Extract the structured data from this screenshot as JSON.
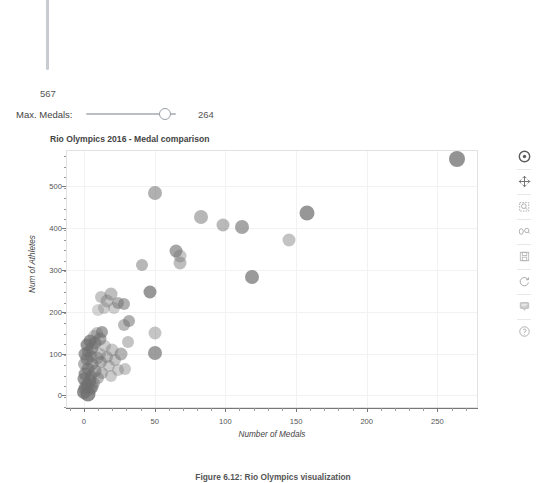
{
  "widgets": {
    "vertical_slider": {
      "name": "max-athletes-slider",
      "value": "567"
    },
    "horizontal_slider": {
      "label": "Max. Medals:",
      "value": "264",
      "handle_position_pct": 81
    }
  },
  "plot": {
    "title": "Rio Olympics 2016 - Medal comparison",
    "toolbar_icons": [
      "bokeh-logo-icon",
      "pan-icon",
      "box-zoom-icon",
      "wheel-zoom-icon",
      "save-icon",
      "reset-icon",
      "hover-icon",
      "help-icon"
    ]
  },
  "caption": "Figure 6.12: Rio Olympics visualization",
  "colors": {
    "point": "#6f6f6f",
    "grid": "#f2f2f2",
    "frame_border": "#e2e2e2",
    "axis": "#777777",
    "text": "#444444"
  },
  "chart_data": {
    "type": "scatter",
    "title": "Rio Olympics 2016 - Medal comparison",
    "xlabel": "Number of Medals",
    "ylabel": "Num of Athletes",
    "xlim": [
      -12,
      278
    ],
    "ylim": [
      -28,
      585
    ],
    "xticks": [
      0,
      50,
      100,
      150,
      200,
      250
    ],
    "yticks": [
      0,
      100,
      200,
      300,
      400,
      500
    ],
    "grid": true,
    "legend": null,
    "marker": "circle",
    "points": [
      {
        "x": 264,
        "y": 567,
        "r": 8.0,
        "a": 0.75
      },
      {
        "x": 50,
        "y": 484,
        "r": 7.0,
        "a": 0.55
      },
      {
        "x": 158,
        "y": 437,
        "r": 7.5,
        "a": 0.72
      },
      {
        "x": 83,
        "y": 427,
        "r": 7.0,
        "a": 0.5
      },
      {
        "x": 98,
        "y": 408,
        "r": 6.5,
        "a": 0.48
      },
      {
        "x": 112,
        "y": 402,
        "r": 7.0,
        "a": 0.62
      },
      {
        "x": 145,
        "y": 372,
        "r": 6.5,
        "a": 0.42
      },
      {
        "x": 65,
        "y": 346,
        "r": 6.5,
        "a": 0.62
      },
      {
        "x": 68,
        "y": 333,
        "r": 6.5,
        "a": 0.38
      },
      {
        "x": 68,
        "y": 318,
        "r": 6.5,
        "a": 0.45
      },
      {
        "x": 41,
        "y": 312,
        "r": 6.0,
        "a": 0.5
      },
      {
        "x": 119,
        "y": 284,
        "r": 7.0,
        "a": 0.7
      },
      {
        "x": 47,
        "y": 248,
        "r": 6.5,
        "a": 0.72
      },
      {
        "x": 19,
        "y": 242,
        "r": 6.5,
        "a": 0.45
      },
      {
        "x": 12,
        "y": 236,
        "r": 6.0,
        "a": 0.4
      },
      {
        "x": 16,
        "y": 225,
        "r": 6.5,
        "a": 0.4
      },
      {
        "x": 24,
        "y": 222,
        "r": 6.0,
        "a": 0.52
      },
      {
        "x": 28,
        "y": 218,
        "r": 6.0,
        "a": 0.55
      },
      {
        "x": 14,
        "y": 210,
        "r": 6.0,
        "a": 0.34
      },
      {
        "x": 21,
        "y": 208,
        "r": 6.0,
        "a": 0.34
      },
      {
        "x": 10,
        "y": 205,
        "r": 6.0,
        "a": 0.3
      },
      {
        "x": 32,
        "y": 178,
        "r": 6.0,
        "a": 0.55
      },
      {
        "x": 28,
        "y": 168,
        "r": 6.0,
        "a": 0.48
      },
      {
        "x": 50,
        "y": 150,
        "r": 6.5,
        "a": 0.4
      },
      {
        "x": 13,
        "y": 152,
        "r": 6.0,
        "a": 0.62
      },
      {
        "x": 9,
        "y": 148,
        "r": 6.0,
        "a": 0.42
      },
      {
        "x": 11,
        "y": 136,
        "r": 6.5,
        "a": 0.58
      },
      {
        "x": 4,
        "y": 130,
        "r": 6.5,
        "a": 0.7
      },
      {
        "x": 8,
        "y": 126,
        "r": 6.5,
        "a": 0.66
      },
      {
        "x": 31,
        "y": 128,
        "r": 6.0,
        "a": 0.42
      },
      {
        "x": 2,
        "y": 120,
        "r": 6.5,
        "a": 0.72
      },
      {
        "x": 6,
        "y": 113,
        "r": 6.5,
        "a": 0.6
      },
      {
        "x": 20,
        "y": 108,
        "r": 6.5,
        "a": 0.38
      },
      {
        "x": 3,
        "y": 104,
        "r": 6.0,
        "a": 0.58
      },
      {
        "x": 50,
        "y": 101,
        "r": 7.0,
        "a": 0.68
      },
      {
        "x": 26,
        "y": 100,
        "r": 6.5,
        "a": 0.52
      },
      {
        "x": 1,
        "y": 98,
        "r": 6.5,
        "a": 0.66
      },
      {
        "x": 5,
        "y": 94,
        "r": 6.0,
        "a": 0.5
      },
      {
        "x": 9,
        "y": 90,
        "r": 6.5,
        "a": 0.46
      },
      {
        "x": 16,
        "y": 92,
        "r": 6.0,
        "a": 0.44
      },
      {
        "x": 2,
        "y": 86,
        "r": 6.5,
        "a": 0.6
      },
      {
        "x": 22,
        "y": 84,
        "r": 6.0,
        "a": 0.4
      },
      {
        "x": 12,
        "y": 80,
        "r": 6.0,
        "a": 0.5
      },
      {
        "x": 6,
        "y": 76,
        "r": 6.5,
        "a": 0.55
      },
      {
        "x": 0,
        "y": 74,
        "r": 6.0,
        "a": 0.52
      },
      {
        "x": 18,
        "y": 70,
        "r": 6.0,
        "a": 0.36
      },
      {
        "x": 29,
        "y": 62,
        "r": 6.0,
        "a": 0.38
      },
      {
        "x": 3,
        "y": 64,
        "r": 6.5,
        "a": 0.62
      },
      {
        "x": 8,
        "y": 58,
        "r": 6.5,
        "a": 0.56
      },
      {
        "x": 13,
        "y": 54,
        "r": 6.0,
        "a": 0.44
      },
      {
        "x": 1,
        "y": 50,
        "r": 6.5,
        "a": 0.68
      },
      {
        "x": 5,
        "y": 46,
        "r": 6.0,
        "a": 0.58
      },
      {
        "x": 10,
        "y": 42,
        "r": 6.0,
        "a": 0.48
      },
      {
        "x": 0,
        "y": 38,
        "r": 6.5,
        "a": 0.7
      },
      {
        "x": 4,
        "y": 34,
        "r": 6.5,
        "a": 0.64
      },
      {
        "x": 7,
        "y": 30,
        "r": 6.0,
        "a": 0.5
      },
      {
        "x": 2,
        "y": 24,
        "r": 6.5,
        "a": 0.72
      },
      {
        "x": 1,
        "y": 18,
        "r": 6.5,
        "a": 0.66
      },
      {
        "x": 5,
        "y": 14,
        "r": 6.0,
        "a": 0.52
      },
      {
        "x": 0,
        "y": 8,
        "r": 7.0,
        "a": 0.78
      },
      {
        "x": 3,
        "y": 2,
        "r": 7.5,
        "a": 0.8
      },
      {
        "x": 11,
        "y": 100,
        "r": 6.0,
        "a": 0.4
      },
      {
        "x": 15,
        "y": 118,
        "r": 6.0,
        "a": 0.34
      },
      {
        "x": 7,
        "y": 142,
        "r": 6.0,
        "a": 0.36
      },
      {
        "x": 24,
        "y": 60,
        "r": 6.0,
        "a": 0.34
      },
      {
        "x": 19,
        "y": 46,
        "r": 6.0,
        "a": 0.36
      },
      {
        "x": 6,
        "y": 20,
        "r": 6.5,
        "a": 0.62
      }
    ]
  }
}
